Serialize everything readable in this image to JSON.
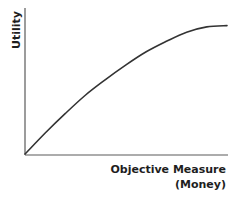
{
  "chart_data": {
    "type": "line",
    "title": "",
    "xlabel": "Objective Measure (Money)",
    "xlabel_lines": [
      "Objective Measure",
      "(Money)"
    ],
    "ylabel": "Utility",
    "grid": false,
    "legend": null,
    "ticks": {
      "x": [],
      "y": []
    },
    "xlim": [
      0,
      1
    ],
    "ylim": [
      0,
      1
    ],
    "series": [
      {
        "name": "Utility curve",
        "color": "#333333",
        "x": [
          0,
          0.1,
          0.2,
          0.3,
          0.4,
          0.5,
          0.6,
          0.7,
          0.8,
          0.9,
          1.0
        ],
        "y": [
          0,
          0.16,
          0.31,
          0.45,
          0.57,
          0.68,
          0.78,
          0.86,
          0.93,
          0.97,
          0.98
        ]
      }
    ]
  },
  "axes": {
    "color": "#5a5a5a",
    "ylabel": "Utility",
    "xlabel_line1": "Objective Measure",
    "xlabel_line2": "(Money)"
  }
}
